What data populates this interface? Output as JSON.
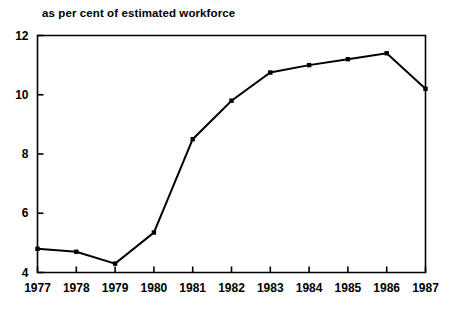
{
  "chart_data": {
    "type": "line",
    "title": "as per cent of estimated workforce",
    "xlabel": "",
    "ylabel": "",
    "categories": [
      "1977",
      "1978",
      "1979",
      "1980",
      "1981",
      "1982",
      "1983",
      "1984",
      "1985",
      "1986",
      "1987"
    ],
    "values": [
      4.8,
      4.7,
      4.3,
      5.35,
      8.5,
      9.8,
      10.75,
      11.0,
      11.2,
      11.4,
      10.2
    ],
    "series": [
      {
        "name": "as per cent of estimated workforce",
        "values": [
          4.8,
          4.7,
          4.3,
          5.35,
          8.5,
          9.8,
          10.75,
          11.0,
          11.2,
          11.4,
          10.2
        ]
      }
    ],
    "ylim": [
      4,
      12
    ],
    "y_ticks": [
      "4",
      "6",
      "8",
      "10",
      "12"
    ],
    "y_tick_values": [
      4,
      6,
      8,
      10,
      12
    ],
    "x_ticks": [
      "1977",
      "1978",
      "1979",
      "1980",
      "1981",
      "1982",
      "1983",
      "1984",
      "1985",
      "1986",
      "1987"
    ],
    "grid": false,
    "legend": false,
    "legend_position": "none",
    "line_color": "#000000",
    "marker_color": "#000000",
    "marker": "square",
    "background_color": "#ffffff",
    "axis_color": "#000000"
  }
}
